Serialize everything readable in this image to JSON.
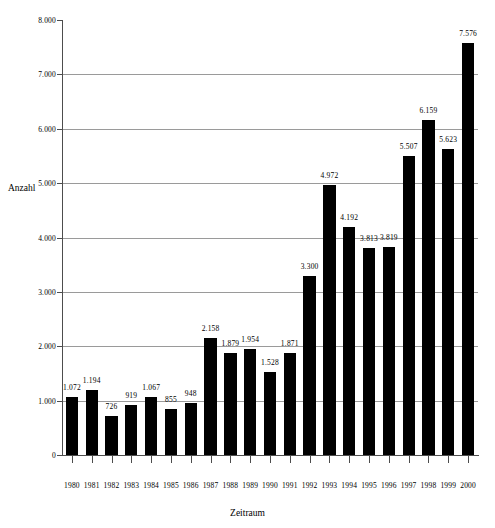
{
  "chart_data": {
    "type": "bar",
    "title": "",
    "xlabel": "Zeitraum",
    "ylabel": "Anzahl",
    "categories": [
      "1980",
      "1981",
      "1982",
      "1983",
      "1984",
      "1985",
      "1986",
      "1987",
      "1988",
      "1989",
      "1990",
      "1991",
      "1992",
      "1993",
      "1994",
      "1995",
      "1996",
      "1997",
      "1998",
      "1999",
      "2000"
    ],
    "values": [
      1072,
      1194,
      726,
      919,
      1067,
      855,
      948,
      2158,
      1879,
      1954,
      1528,
      1871,
      3300,
      4972,
      4192,
      3813,
      3819,
      5507,
      6159,
      5623,
      7576
    ],
    "value_labels": [
      "1.072",
      "1.194",
      "726",
      "919",
      "1.067",
      "855",
      "948",
      "2.158",
      "1.879",
      "1.954",
      "1.528",
      "1.871",
      "3.300",
      "4.972",
      "4.192",
      "3.813",
      "3.819",
      "5.507",
      "6.159",
      "5.623",
      "7.576"
    ],
    "ylim": [
      0,
      8000
    ],
    "ytick_values": [
      0,
      1000,
      2000,
      3000,
      4000,
      5000,
      6000,
      7000,
      8000
    ],
    "ytick_labels": [
      "0",
      "1.000",
      "2.000",
      "3.000",
      "4.000",
      "5.000",
      "6.000",
      "7.000",
      "8.000"
    ],
    "grid": true,
    "grid_axis": "y",
    "legend": false,
    "bar_color": "#000000",
    "grid_color": "#9a9a9a",
    "axis_color": "#4d4d4d",
    "background_color": "#ffffff"
  }
}
